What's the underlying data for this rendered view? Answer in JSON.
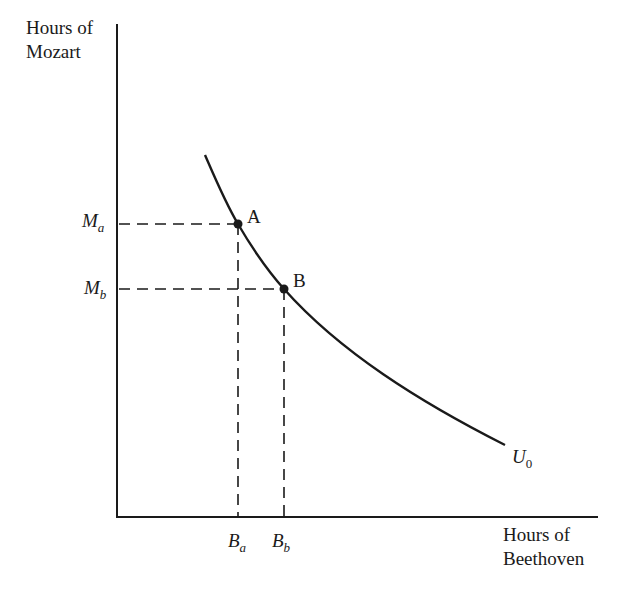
{
  "diagram": {
    "type": "indifference-curve",
    "y_axis": {
      "label_line1": "Hours of",
      "label_line2": "Mozart"
    },
    "x_axis": {
      "label_line1": "Hours of",
      "label_line2": "Beethoven"
    },
    "curve": {
      "label_main": "U",
      "label_sub": "0"
    },
    "points": [
      {
        "name": "A",
        "x_label_main": "B",
        "x_label_sub": "a",
        "y_label_main": "M",
        "y_label_sub": "a"
      },
      {
        "name": "B",
        "x_label_main": "B",
        "x_label_sub": "b",
        "y_label_main": "M",
        "y_label_sub": "b"
      }
    ],
    "colors": {
      "ink": "#1a1a1a",
      "background": "#ffffff"
    }
  }
}
